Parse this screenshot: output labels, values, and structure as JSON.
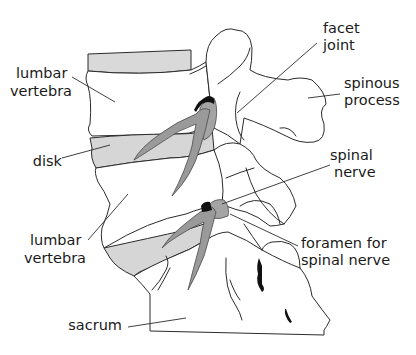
{
  "diagram": {
    "colors": {
      "background": "#ffffff",
      "outline": "#2b2b2b",
      "disk_fill": "#d6d6d6",
      "nerve_fill": "#9a9a9a",
      "dark_accent": "#111111"
    },
    "labels": {
      "lumbar_vertebra_top": [
        "lumbar",
        "vertebra"
      ],
      "disk": [
        "disk"
      ],
      "lumbar_vertebra_bottom": [
        "lumbar",
        "vertebra"
      ],
      "sacrum": [
        "sacrum"
      ],
      "facet_joint": [
        "facet",
        "joint"
      ],
      "spinous_process": [
        "spinous",
        "process"
      ],
      "spinal_nerve": [
        "spinal",
        "nerve"
      ],
      "foramen": [
        "foramen for",
        "spinal nerve"
      ]
    }
  }
}
